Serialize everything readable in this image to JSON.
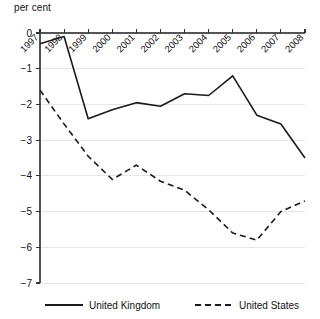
{
  "chart_data": {
    "type": "line",
    "title": "",
    "subtitle": "",
    "unit_label": "per cent",
    "xlabel": "",
    "ylabel": "",
    "categories": [
      "1997",
      "1998",
      "1999",
      "2000",
      "2001",
      "2002",
      "2003",
      "2004",
      "2005",
      "2006",
      "2007",
      "2008"
    ],
    "xlim": [
      1997,
      2008
    ],
    "ylim": [
      -7,
      0
    ],
    "yticks": [
      0,
      -1,
      -2,
      -3,
      -4,
      -5,
      -6,
      -7
    ],
    "ytick_labels": [
      "0",
      "−1",
      "−2",
      "−3",
      "−4",
      "−5",
      "−6",
      "−7"
    ],
    "grid": true,
    "grid_axis": "y",
    "legend_position": "bottom",
    "series": [
      {
        "name": "United Kingdom",
        "style": "solid",
        "color": "#1a1a1a",
        "values": [
          -0.3,
          -0.1,
          -2.4,
          -2.15,
          -1.95,
          -2.05,
          -1.7,
          -1.75,
          -1.2,
          -2.3,
          -2.55,
          -3.5
        ]
      },
      {
        "name": "United States",
        "style": "dashed",
        "color": "#1a1a1a",
        "values": [
          -1.6,
          -2.55,
          -3.45,
          -4.1,
          -3.7,
          -4.15,
          -4.4,
          -4.95,
          -5.6,
          -5.8,
          -5.0,
          -4.7
        ]
      }
    ]
  },
  "legend": {
    "items": [
      {
        "label": "United Kingdom",
        "style": "solid"
      },
      {
        "label": "United States",
        "style": "dashed"
      }
    ]
  },
  "axis": {
    "unit": "per cent"
  }
}
